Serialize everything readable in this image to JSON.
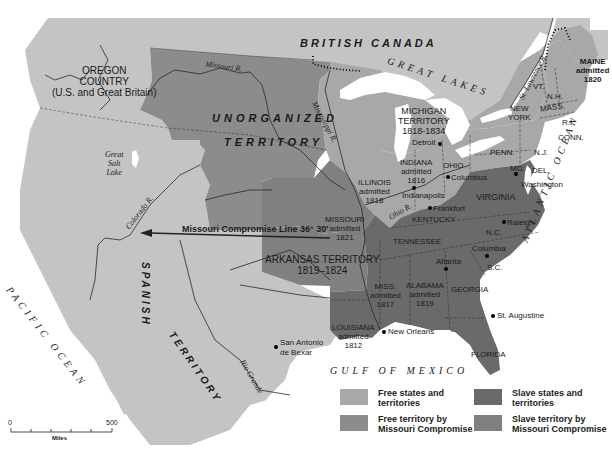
{
  "map": {
    "title_fragment": "Missouri Compromise, 1820",
    "colors": {
      "ocean": "#ffffff",
      "foreign": "#c4c4c4",
      "free_states": "#a8a8a8",
      "free_territory_mc": "#8c8c8c",
      "slave_states": "#6a6a6a",
      "slave_territory_mc": "#808080",
      "lakes": "#ffffff",
      "lines": "#2a2a2a"
    },
    "regions": {
      "british_canada": "BRITISH CANADA",
      "oregon": [
        "OREGON",
        "COUNTRY",
        "(U.S. and Great Britain)"
      ],
      "unorganized": [
        "UNORGANIZED",
        "TERRITORY"
      ],
      "spanish": [
        "SPANISH",
        "TERRITORY"
      ],
      "great_lakes": "GREAT LAKES",
      "michigan": [
        "MICHIGAN",
        "TERRITORY",
        "1818-1834"
      ],
      "arkansas": [
        "ARKANSAS TERRITORY",
        "1819–1824"
      ]
    },
    "states": {
      "maine": [
        "MAINE",
        "admitted",
        "1820"
      ],
      "vt": "VT.",
      "nh": "N.H.",
      "mass": "MASS.",
      "ri": "R.I.",
      "conn": "CONN.",
      "ny": [
        "NEW",
        "YORK"
      ],
      "penn": "PENN.",
      "nj": "N.J.",
      "md": "MD.",
      "del": "DEL.",
      "ohio": "OHIO",
      "indiana": [
        "INDIANA",
        "admitted",
        "1816"
      ],
      "illinois": [
        "ILLINOIS",
        "admitted",
        "1818"
      ],
      "missouri": [
        "MISSOURI",
        "admitted",
        "1821"
      ],
      "virginia": "VIRGINIA",
      "kentucky": "KENTUCKY",
      "tennessee": "TENNESSEE",
      "nc": "N.C.",
      "sc": "S.C.",
      "georgia": "GEORGIA",
      "alabama": [
        "ALABAMA",
        "admitted",
        "1819"
      ],
      "miss": [
        "MISS.",
        "admitted",
        "1817"
      ],
      "louisiana": [
        "LOUISIANA",
        "admitted",
        "1812"
      ],
      "florida": "FLORIDA"
    },
    "cities": {
      "detroit": "Detroit",
      "columbus": "Columbus",
      "indianapolis": "Indianapolis",
      "frankfort": "Frankfort",
      "washington": "Washington",
      "raleigh": "Raleigh",
      "columbia": "Columbia",
      "atlanta": "Atlanta",
      "st_augustine": "St. Augustine",
      "new_orleans": "New Orleans",
      "san_antonio": [
        "San Antonio",
        "de Bexar"
      ]
    },
    "rivers": {
      "missouri": "Missouri R.",
      "mississippi": "Mississippi R.",
      "ohio": "Ohio R.",
      "st_lawrence": "St. Lawrence R.",
      "colorado": "Colorado R.",
      "rio_grande": "Rio Grande"
    },
    "lakes": {
      "great_salt": [
        "Great",
        "Salt",
        "Lake"
      ]
    },
    "oceans": {
      "pacific": "PACIFIC OCEAN",
      "atlantic": "ATLANTIC OCEAN",
      "gulf": "GULF OF MEXICO"
    },
    "compromise_line": "Missouri Compromise Line 36° 30'",
    "scale": {
      "start": "0",
      "end": "500",
      "unit": "Miles"
    },
    "legend": [
      {
        "label": "Free states and territories",
        "color": "#a8a8a8"
      },
      {
        "label": "Slave states and territories",
        "color": "#6a6a6a"
      },
      {
        "label": "Free territory by Missouri Compromise",
        "color": "#8c8c8c"
      },
      {
        "label": "Slave territory by Missouri Compromise",
        "color": "#808080"
      }
    ]
  }
}
